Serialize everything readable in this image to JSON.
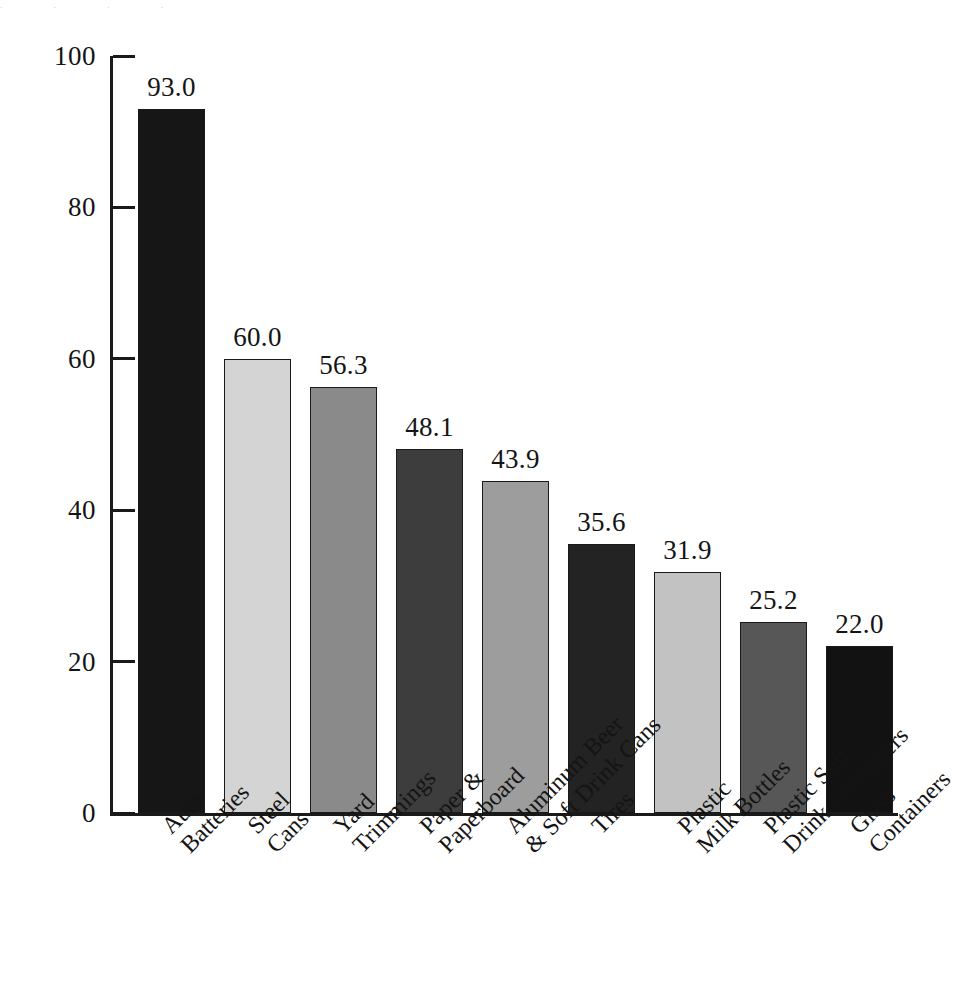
{
  "figure": {
    "top_cut_text": ". . . .",
    "background_color": "#ffffff",
    "ink_color": "#1a1a1a"
  },
  "chart_data": {
    "type": "bar",
    "title": "",
    "xlabel": "",
    "ylabel": "",
    "ylim": [
      0,
      100
    ],
    "yticks": [
      "0",
      "20",
      "40",
      "60",
      "80",
      "100"
    ],
    "grid": false,
    "legend": "none",
    "value_labels": true,
    "categories": [
      "Auto Batteries",
      "Steel Cans",
      "Yard Trimmings",
      "Paper & Paperboard",
      "Aluminum Beer & Soft Drink Cans",
      "Tires",
      "Plastic Milk Bottles",
      "Plastic Soft Drink Containers",
      "Glass Containers"
    ],
    "category_lines": [
      [
        "Auto",
        "Batteries"
      ],
      [
        "Steel",
        "Cans"
      ],
      [
        "Yard",
        "Trimmings"
      ],
      [
        "Paper &",
        "Paperboard"
      ],
      [
        "Aluminum Beer",
        "& Soft Drink Cans"
      ],
      [
        "Tires",
        ""
      ],
      [
        "Plastic",
        "Milk Bottles"
      ],
      [
        "Plastic Soft",
        "Drink Containers"
      ],
      [
        "Glass",
        "Containers"
      ]
    ],
    "values": [
      93.0,
      60.0,
      56.3,
      48.1,
      43.9,
      35.6,
      31.9,
      25.2,
      22.0
    ],
    "value_labels_text": [
      "93.0",
      "60.0",
      "56.3",
      "48.1",
      "43.9",
      "35.6",
      "31.9",
      "25.2",
      "22.0"
    ],
    "bar_colors": [
      "#161616",
      "#d4d4d4",
      "#8a8a8a",
      "#3d3d3d",
      "#9d9d9d",
      "#232323",
      "#c2c2c2",
      "#575757",
      "#121212"
    ]
  }
}
